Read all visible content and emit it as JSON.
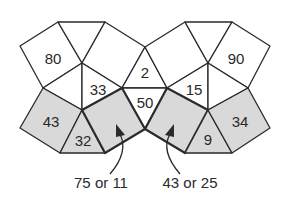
{
  "diagram": {
    "colors": {
      "line": "#2a2a2a",
      "shaded": "#d9d9d9",
      "white": "#ffffff"
    },
    "faces": [
      {
        "id": "sq-80",
        "label": "80",
        "shaded": false
      },
      {
        "id": "sq-90",
        "label": "90",
        "shaded": false
      },
      {
        "id": "tri-2",
        "label": "2",
        "shaded": false
      },
      {
        "id": "tri-33",
        "label": "33",
        "shaded": false
      },
      {
        "id": "tri-15",
        "label": "15",
        "shaded": false
      },
      {
        "id": "tri-50",
        "label": "50",
        "shaded": false
      },
      {
        "id": "sq-43",
        "label": "43",
        "shaded": true
      },
      {
        "id": "tri-32",
        "label": "32",
        "shaded": true
      },
      {
        "id": "tri-9",
        "label": "9",
        "shaded": true
      },
      {
        "id": "sq-34",
        "label": "34",
        "shaded": true
      }
    ],
    "callouts": [
      {
        "id": "left-arrow",
        "label": "75 or 11"
      },
      {
        "id": "right-arrow",
        "label": "43 or 25"
      }
    ]
  }
}
